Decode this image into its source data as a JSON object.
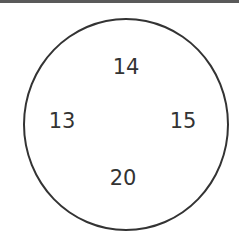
{
  "diagram": {
    "shape": "circle",
    "numbers": {
      "top": "14",
      "left": "13",
      "right": "15",
      "bottom": "20"
    }
  }
}
